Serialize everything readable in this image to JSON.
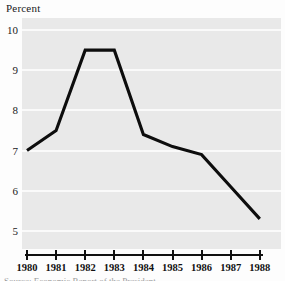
{
  "chart_data": {
    "type": "line",
    "title": "",
    "ylabel": "Percent",
    "xlabel": "",
    "categories": [
      "1980",
      "1981",
      "1982",
      "1983",
      "1984",
      "1985",
      "1986",
      "1987",
      "1988"
    ],
    "x": [
      1980,
      1981,
      1982,
      1983,
      1984,
      1985,
      1986,
      1987,
      1988
    ],
    "values": [
      7.0,
      7.5,
      9.5,
      9.5,
      7.4,
      7.1,
      6.9,
      6.1,
      5.3
    ],
    "series": [
      {
        "name": "Percent",
        "values": [
          7.0,
          7.5,
          9.5,
          9.5,
          7.4,
          7.1,
          6.9,
          6.1,
          5.3
        ]
      }
    ],
    "ylim": [
      4.55,
      10.3
    ],
    "xlim": [
      1980,
      1988
    ],
    "yticks": [
      10,
      9,
      8,
      7,
      6,
      5
    ],
    "ytick_labels": [
      "10",
      "9",
      "8",
      "7",
      "6",
      "5"
    ],
    "xtick_labels": [
      "1980",
      "1981",
      "1982",
      "1983",
      "1984",
      "1985",
      "1986",
      "1987",
      "1988"
    ],
    "grid": "horizontal",
    "legend": "none",
    "annotations": []
  },
  "style": {
    "panel_background": "#e9e9e9",
    "gridline_color": "#fafafa",
    "line_color": "#0d0d0d",
    "axis_color": "#111111",
    "text_color": "#1a1a1a",
    "page_background": "#fdfdfd"
  },
  "caption": {
    "clipped_text": "Source: Economic Report of the President"
  }
}
